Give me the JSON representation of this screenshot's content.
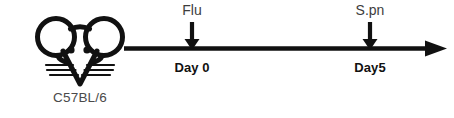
{
  "figure": {
    "background_color": "#ffffff",
    "line_color": "#111111",
    "label_color": "#3d3d3d",
    "bold_label_color": "#111111"
  },
  "subject": {
    "icon": "mouse-head-icon",
    "strain_label": "C57BL/6"
  },
  "timeline": {
    "axis_icon": "right-arrow-icon",
    "events": [
      {
        "top_label": "Flu",
        "bottom_label": "Day 0",
        "marker_icon": "down-arrow-icon"
      },
      {
        "top_label": "S.pn",
        "bottom_label": "Day5",
        "marker_icon": "down-arrow-icon"
      }
    ]
  }
}
